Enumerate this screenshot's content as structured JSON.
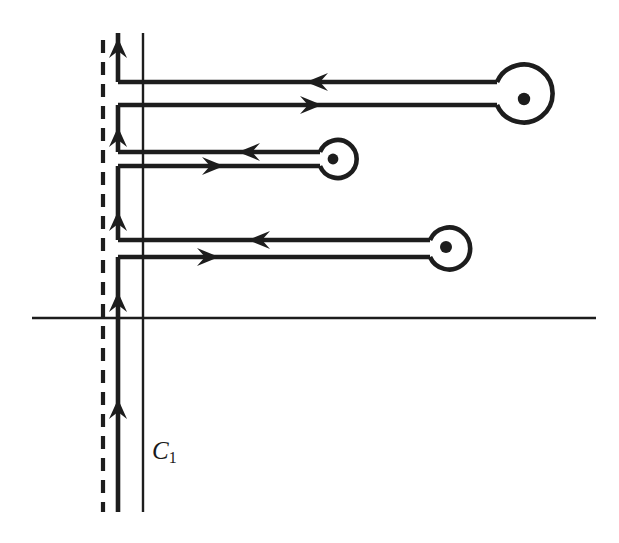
{
  "figure": {
    "background_color": "#ffffff",
    "ink_color": "#1d1d1d",
    "width": 619,
    "height": 543,
    "labels": [
      {
        "name": "contour-label",
        "base": "C",
        "subscript": "1",
        "x": 152,
        "y": 437
      }
    ],
    "axes": {
      "real_axis": {
        "name": "real-axis",
        "x1": 32,
        "y1": 318,
        "x2": 596,
        "y2": 318,
        "stroke_width": 2.2
      },
      "imaginary_axis": {
        "name": "imaginary-axis",
        "x1": 143,
        "y1": 33,
        "x2": 143,
        "y2": 512,
        "stroke_width": 2.2
      }
    },
    "branch_cut": {
      "name": "branch-cut-dashed-line",
      "x": 103,
      "y_top": 40,
      "y_bottom": 512,
      "stroke_width": 4.0,
      "dash_pattern": "13 9"
    },
    "contour": {
      "name": "contour-path-c1",
      "stroke_width": 4.6,
      "vertical_line_x": 118,
      "y_top": 33,
      "y_bottom": 512,
      "direction_arrows_up": [
        {
          "name": "up-arrow-top",
          "x": 118,
          "y": 50
        },
        {
          "name": "up-arrow-second",
          "x": 118,
          "y": 138
        },
        {
          "name": "up-arrow-third",
          "x": 118,
          "y": 222
        },
        {
          "name": "up-arrow-above-axis",
          "x": 118,
          "y": 303
        },
        {
          "name": "up-arrow-lower",
          "x": 118,
          "y": 410
        }
      ],
      "excursions": [
        {
          "name": "excursion-1",
          "y_outbound": 105,
          "y_inbound": 82,
          "x_left": 118,
          "pole": {
            "name": "pole-1",
            "cx": 524,
            "cy": 99,
            "r": 29,
            "dot_r": 6
          },
          "arrow_inbound": {
            "name": "left-arrow-branch-1",
            "x": 322,
            "y": 82,
            "dir": "left"
          },
          "arrow_outbound": {
            "name": "right-arrow-branch-1",
            "x": 311,
            "y": 105,
            "dir": "right"
          }
        },
        {
          "name": "excursion-2",
          "y_outbound": 166,
          "y_inbound": 152,
          "x_left": 118,
          "pole": {
            "name": "pole-2",
            "cx": 333,
            "cy": 159,
            "r": 19,
            "dot_r": 5
          },
          "arrow_inbound": {
            "name": "left-arrow-branch-2",
            "x": 252,
            "y": 152,
            "dir": "left"
          },
          "arrow_outbound": {
            "name": "right-arrow-branch-2",
            "x": 212,
            "y": 166,
            "dir": "right"
          }
        },
        {
          "name": "excursion-3",
          "y_outbound": 257,
          "y_inbound": 240,
          "x_left": 118,
          "pole": {
            "name": "pole-3",
            "cx": 446,
            "cy": 247,
            "r": 21,
            "dot_r": 6
          },
          "arrow_inbound": {
            "name": "left-arrow-branch-3",
            "x": 262,
            "y": 240,
            "dir": "left"
          },
          "arrow_outbound": {
            "name": "right-arrow-branch-3",
            "x": 207,
            "y": 257,
            "dir": "right"
          }
        }
      ]
    }
  }
}
